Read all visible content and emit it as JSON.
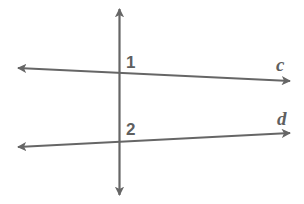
{
  "diagram": {
    "line_color": "#666666",
    "label_color": "#5f5f5f",
    "angles": [
      {
        "label": "1"
      },
      {
        "label": "2"
      }
    ],
    "lines": [
      {
        "name": "c"
      },
      {
        "name": "d"
      }
    ],
    "transversal": {
      "name": "transversal"
    }
  }
}
